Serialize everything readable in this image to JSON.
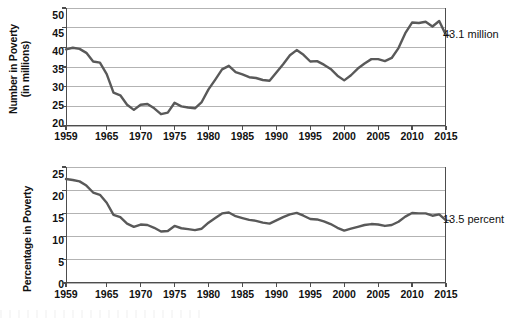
{
  "figure": {
    "background": "#ffffff",
    "line_color": "#595959",
    "axis_color": "#4d4d4d",
    "grid_color": "#b3b3b3",
    "text_color": "#111111"
  },
  "charts": [
    {
      "id": "number-in-poverty",
      "axis_title_line1": "Number in Poverty",
      "axis_title_line2": "(in millions)",
      "annotation": "43.1 million",
      "yticks": [
        "50",
        "45",
        "40",
        "35",
        "30",
        "25",
        "20"
      ],
      "xticks": [
        "1959",
        "1965",
        "1970",
        "1975",
        "1980",
        "1985",
        "1990",
        "1995",
        "2000",
        "2005",
        "2010",
        "2015"
      ]
    },
    {
      "id": "percentage-in-poverty",
      "axis_title_line1": "Percentage in Poverty",
      "axis_title_line2": "",
      "annotation": "13.5 percent",
      "yticks": [
        "25",
        "20",
        "15",
        "10",
        "5",
        "0"
      ],
      "xticks": [
        "1959",
        "1965",
        "1970",
        "1975",
        "1980",
        "1985",
        "1990",
        "1995",
        "2000",
        "2005",
        "2010",
        "2015"
      ]
    }
  ],
  "chart_data": [
    {
      "type": "line",
      "title": "Number in Poverty (in millions)",
      "xlabel": "",
      "ylabel": "Number in Poverty (in millions)",
      "xlim": [
        1959,
        2015
      ],
      "ylim": [
        20,
        50
      ],
      "ytick_values": [
        20,
        25,
        30,
        35,
        40,
        45,
        50
      ],
      "xtick_values": [
        1959,
        1965,
        1970,
        1975,
        1980,
        1985,
        1990,
        1995,
        2000,
        2005,
        2010,
        2015
      ],
      "grid": true,
      "legend": "none",
      "annotations": [
        {
          "text": "43.1 million",
          "x": 2015,
          "y": 43.1
        }
      ],
      "series": [
        {
          "name": "Number in poverty (millions)",
          "x": [
            1959,
            1960,
            1961,
            1962,
            1963,
            1964,
            1965,
            1966,
            1967,
            1968,
            1969,
            1970,
            1971,
            1972,
            1973,
            1974,
            1975,
            1976,
            1977,
            1978,
            1979,
            1980,
            1981,
            1982,
            1983,
            1984,
            1985,
            1986,
            1987,
            1988,
            1989,
            1990,
            1991,
            1992,
            1993,
            1994,
            1995,
            1996,
            1997,
            1998,
            1999,
            2000,
            2001,
            2002,
            2003,
            2004,
            2005,
            2006,
            2007,
            2008,
            2009,
            2010,
            2011,
            2012,
            2013,
            2014,
            2015
          ],
          "values": [
            39.5,
            39.9,
            39.6,
            38.6,
            36.4,
            36.1,
            33.2,
            28.5,
            27.8,
            25.4,
            24.1,
            25.4,
            25.6,
            24.5,
            23.0,
            23.4,
            25.9,
            25.0,
            24.7,
            24.5,
            26.1,
            29.3,
            31.8,
            34.4,
            35.3,
            33.7,
            33.1,
            32.4,
            32.2,
            31.7,
            31.5,
            33.6,
            35.7,
            38.0,
            39.3,
            38.1,
            36.4,
            36.5,
            35.6,
            34.5,
            32.8,
            31.6,
            32.9,
            34.6,
            35.9,
            37.0,
            37.0,
            36.5,
            37.3,
            39.8,
            43.6,
            46.3,
            46.2,
            46.5,
            45.3,
            46.7,
            43.1
          ]
        }
      ]
    },
    {
      "type": "line",
      "title": "Percentage in Poverty",
      "xlabel": "",
      "ylabel": "Percentage in Poverty",
      "xlim": [
        1959,
        2015
      ],
      "ylim": [
        0,
        25
      ],
      "ytick_values": [
        0,
        5,
        10,
        15,
        20,
        25
      ],
      "xtick_values": [
        1959,
        1965,
        1970,
        1975,
        1980,
        1985,
        1990,
        1995,
        2000,
        2005,
        2010,
        2015
      ],
      "grid": true,
      "legend": "none",
      "annotations": [
        {
          "text": "13.5 percent",
          "x": 2015,
          "y": 13.5
        }
      ],
      "series": [
        {
          "name": "Percentage in poverty",
          "x": [
            1959,
            1960,
            1961,
            1962,
            1963,
            1964,
            1965,
            1966,
            1967,
            1968,
            1969,
            1970,
            1971,
            1972,
            1973,
            1974,
            1975,
            1976,
            1977,
            1978,
            1979,
            1980,
            1981,
            1982,
            1983,
            1984,
            1985,
            1986,
            1987,
            1988,
            1989,
            1990,
            1991,
            1992,
            1993,
            1994,
            1995,
            1996,
            1997,
            1998,
            1999,
            2000,
            2001,
            2002,
            2003,
            2004,
            2005,
            2006,
            2007,
            2008,
            2009,
            2010,
            2011,
            2012,
            2013,
            2014,
            2015
          ],
          "values": [
            22.4,
            22.2,
            21.9,
            21.0,
            19.5,
            19.0,
            17.3,
            14.7,
            14.2,
            12.8,
            12.1,
            12.6,
            12.5,
            11.9,
            11.1,
            11.2,
            12.3,
            11.8,
            11.6,
            11.4,
            11.7,
            13.0,
            14.0,
            15.0,
            15.2,
            14.4,
            14.0,
            13.6,
            13.4,
            13.0,
            12.8,
            13.5,
            14.2,
            14.8,
            15.1,
            14.5,
            13.8,
            13.7,
            13.3,
            12.7,
            11.9,
            11.3,
            11.7,
            12.1,
            12.5,
            12.7,
            12.6,
            12.3,
            12.5,
            13.2,
            14.3,
            15.1,
            15.0,
            15.0,
            14.5,
            14.8,
            13.5
          ]
        }
      ]
    }
  ]
}
